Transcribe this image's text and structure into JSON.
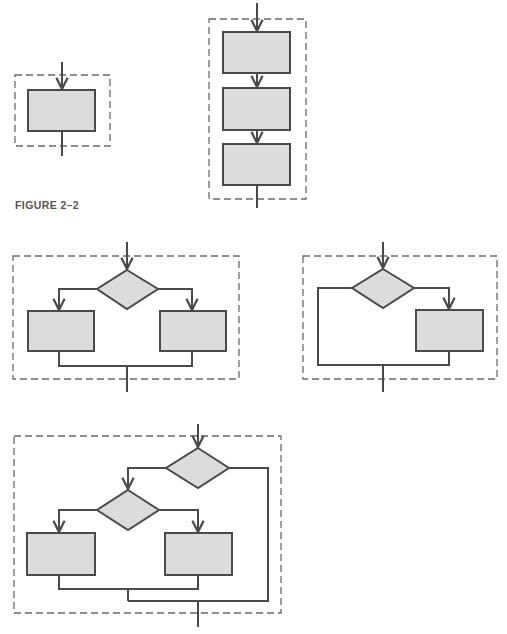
{
  "figure": {
    "caption": "FIGURE 2–2",
    "colors": {
      "background": "#ffffff",
      "stroke": "#4a4a4a",
      "dash": "#6a6a6a",
      "fill": "#dcdcdc",
      "caption": "#555555"
    }
  },
  "structures": [
    {
      "id": "process",
      "label": "Single process block",
      "boxes": 1,
      "decisions": 0
    },
    {
      "id": "sequence",
      "label": "Sequence of three process blocks",
      "boxes": 3,
      "decisions": 0
    },
    {
      "id": "if-then-else",
      "label": "Decision with two process branches",
      "boxes": 2,
      "decisions": 1
    },
    {
      "id": "if-then",
      "label": "Decision with one process branch and bypass",
      "boxes": 1,
      "decisions": 1
    },
    {
      "id": "nested-if",
      "label": "Nested decision with two process branches and bypass",
      "boxes": 2,
      "decisions": 2
    }
  ]
}
